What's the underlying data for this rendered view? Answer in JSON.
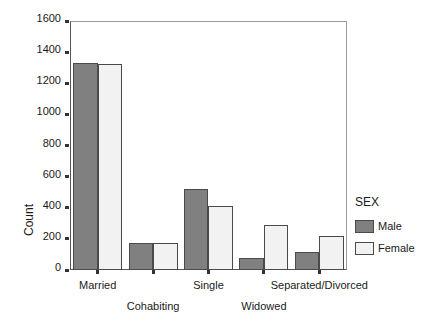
{
  "chart_data": {
    "type": "bar",
    "title": "",
    "xlabel": "",
    "ylabel": "Count",
    "ylim": [
      0,
      1600
    ],
    "ytick_step": 200,
    "yticks": [
      0,
      200,
      400,
      600,
      800,
      1000,
      1200,
      1400,
      1600
    ],
    "ytick_labels": [
      "0",
      "200",
      "400",
      "600",
      "800",
      "1000",
      "1200",
      "1400",
      "1600"
    ],
    "grid": false,
    "categories": [
      "Married",
      "Cohabiting",
      "Single",
      "Widowed",
      "Separated/Divorced"
    ],
    "legend": {
      "title": "SEX",
      "position": "right",
      "entries": [
        {
          "name": "Male",
          "color": "#808080"
        },
        {
          "name": "Female",
          "color": "#f2f2f2"
        }
      ]
    },
    "series": [
      {
        "name": "Male",
        "color": "#808080",
        "values": [
          1330,
          175,
          520,
          78,
          118
        ]
      },
      {
        "name": "Female",
        "color": "#f2f2f2",
        "values": [
          1325,
          175,
          412,
          290,
          218
        ]
      }
    ],
    "annotations": []
  },
  "style": {
    "bar_border_color": "#4a4a4a",
    "axis_color": "#555555",
    "frame_color": "#9a9a9a",
    "text_color": "#1a1a1a",
    "background": "#ffffff"
  }
}
